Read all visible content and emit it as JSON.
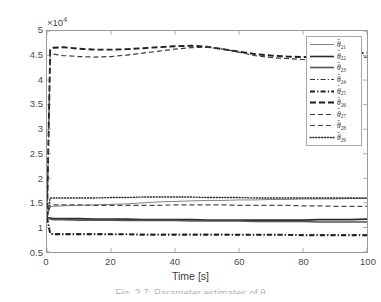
{
  "chart_data": {
    "type": "line",
    "title": "",
    "xlabel": "Time [s]",
    "ylabel": "",
    "y_exponent_label": "×10",
    "y_exponent_power": "4",
    "xlim": [
      0,
      100
    ],
    "ylim": [
      0.5,
      5
    ],
    "y_scale_factor": 10000,
    "xticks": [
      0,
      20,
      40,
      60,
      80,
      100
    ],
    "xtick_labels": [
      "0",
      "20",
      "40",
      "60",
      "80",
      "100"
    ],
    "yticks": [
      0.5,
      1,
      1.5,
      2,
      2.5,
      3,
      3.5,
      4,
      4.5,
      5
    ],
    "ytick_labels": [
      "0.5",
      "1",
      "1.5",
      "2",
      "2.5",
      "3",
      "3.5",
      "4",
      "4.5",
      "5"
    ],
    "grid": false,
    "legend_position": "upper right",
    "x": [
      0,
      1,
      2,
      5,
      10,
      15,
      20,
      25,
      30,
      35,
      40,
      45,
      50,
      55,
      60,
      65,
      70,
      75,
      80,
      85,
      90,
      95,
      100
    ],
    "series": [
      {
        "name": "theta_21",
        "label": "θ",
        "subscript": "21",
        "style": "solid",
        "width": 0.7,
        "color": "#4d4d4d",
        "values": [
          1.2,
          1.42,
          1.43,
          1.44,
          1.45,
          1.46,
          1.47,
          1.48,
          1.5,
          1.52,
          1.53,
          1.54,
          1.55,
          1.55,
          1.56,
          1.56,
          1.57,
          1.57,
          1.58,
          1.58,
          1.58,
          1.59,
          1.59
        ]
      },
      {
        "name": "theta_22",
        "label": "θ",
        "subscript": "22",
        "style": "solid",
        "width": 1.6,
        "color": "#2b2b2b",
        "values": [
          1.2,
          1.19,
          1.18,
          1.18,
          1.18,
          1.17,
          1.17,
          1.17,
          1.16,
          1.16,
          1.16,
          1.16,
          1.15,
          1.15,
          1.15,
          1.15,
          1.15,
          1.15,
          1.15,
          1.16,
          1.16,
          1.16,
          1.17
        ]
      },
      {
        "name": "theta_23",
        "label": "θ",
        "subscript": "23",
        "style": "solid",
        "width": 1.6,
        "color": "#555555",
        "values": [
          1.2,
          1.17,
          1.16,
          1.16,
          1.15,
          1.15,
          1.15,
          1.14,
          1.14,
          1.14,
          1.14,
          1.13,
          1.13,
          1.13,
          1.13,
          1.12,
          1.12,
          1.12,
          1.12,
          1.11,
          1.11,
          1.11,
          1.11
        ]
      },
      {
        "name": "theta_24",
        "label": "θ",
        "subscript": "24",
        "style": "dashdot",
        "width": 1.1,
        "color": "#333333",
        "values": [
          1.2,
          0.88,
          0.87,
          0.87,
          0.87,
          0.87,
          0.86,
          0.86,
          0.86,
          0.86,
          0.86,
          0.86,
          0.86,
          0.86,
          0.85,
          0.85,
          0.85,
          0.85,
          0.85,
          0.85,
          0.85,
          0.85,
          0.85
        ]
      },
      {
        "name": "theta_25",
        "label": "θ",
        "subscript": "25",
        "style": "dashdot",
        "width": 1.9,
        "color": "#1f1f1f",
        "values": [
          1.2,
          0.87,
          0.86,
          0.86,
          0.86,
          0.86,
          0.86,
          0.86,
          0.85,
          0.85,
          0.85,
          0.85,
          0.85,
          0.85,
          0.85,
          0.85,
          0.85,
          0.85,
          0.84,
          0.84,
          0.84,
          0.84,
          0.84
        ]
      },
      {
        "name": "theta_26",
        "label": "θ",
        "subscript": "26",
        "style": "dashed-long",
        "width": 1.9,
        "color": "#1f1f1f",
        "values": [
          1.2,
          4.62,
          4.66,
          4.67,
          4.64,
          4.62,
          4.62,
          4.63,
          4.65,
          4.67,
          4.69,
          4.7,
          4.68,
          4.63,
          4.58,
          4.53,
          4.5,
          4.48,
          4.47,
          4.47,
          4.5,
          4.53,
          4.56
        ]
      },
      {
        "name": "theta_27",
        "label": "θ",
        "subscript": "27",
        "style": "dashed",
        "width": 1.2,
        "color": "#3a3a3a",
        "values": [
          1.2,
          4.55,
          4.53,
          4.5,
          4.48,
          4.47,
          4.48,
          4.51,
          4.55,
          4.59,
          4.63,
          4.66,
          4.67,
          4.63,
          4.57,
          4.5,
          4.46,
          4.44,
          4.42,
          4.4,
          4.42,
          4.45,
          4.47
        ]
      },
      {
        "name": "theta_28",
        "label": "θ",
        "subscript": "28",
        "style": "dashed",
        "width": 1.2,
        "color": "#4a4a4a",
        "values": [
          1.2,
          1.45,
          1.46,
          1.46,
          1.46,
          1.45,
          1.45,
          1.45,
          1.45,
          1.45,
          1.46,
          1.46,
          1.46,
          1.46,
          1.45,
          1.45,
          1.45,
          1.45,
          1.44,
          1.44,
          1.43,
          1.43,
          1.43
        ]
      },
      {
        "name": "theta_29",
        "label": "θ",
        "subscript": "29",
        "style": "dotted",
        "width": 1.3,
        "color": "#2b2b2b",
        "values": [
          1.2,
          1.6,
          1.6,
          1.6,
          1.6,
          1.6,
          1.61,
          1.61,
          1.62,
          1.62,
          1.62,
          1.62,
          1.61,
          1.61,
          1.61,
          1.6,
          1.6,
          1.6,
          1.6,
          1.6,
          1.6,
          1.6,
          1.6
        ]
      }
    ]
  },
  "axis": {
    "x_title": "Time [s]",
    "exponent_prefix": "×10",
    "exponent_power": "4"
  },
  "caption": {
    "text": "Fig. 2.7: Parameter estimates of θ"
  }
}
